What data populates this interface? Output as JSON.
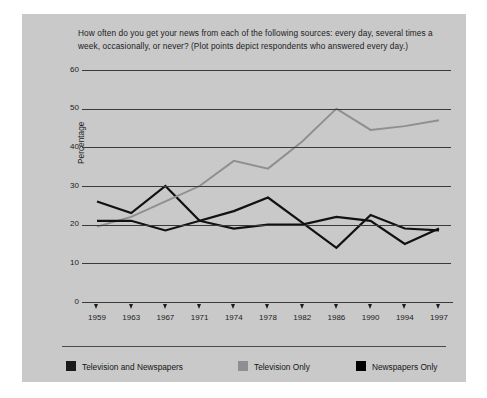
{
  "figure": {
    "background_color": "#c9c9c9",
    "question": "How often do you get your news from each of the following sources: every day, several times a week, occasionally, or never? (Plot points depict respondents who answered every day.)"
  },
  "chart_data": {
    "type": "line",
    "title": "",
    "xlabel": "",
    "ylabel": "Percentage",
    "categories": [
      "1959",
      "1963",
      "1967",
      "1971",
      "1974",
      "1978",
      "1982",
      "1986",
      "1990",
      "1994",
      "1997"
    ],
    "x": [
      1959,
      1963,
      1967,
      1971,
      1974,
      1978,
      1982,
      1986,
      1990,
      1994,
      1997
    ],
    "ylim": [
      0,
      60
    ],
    "yticks": [
      0,
      10,
      20,
      30,
      40,
      50,
      60
    ],
    "grid": true,
    "legend_position": "bottom",
    "series": [
      {
        "name": "Television and Newspapers",
        "color": "#111111",
        "values": [
          26,
          23,
          30,
          21,
          23.5,
          27,
          20.5,
          14,
          22.5,
          19,
          18.5
        ]
      },
      {
        "name": "Television Only",
        "color": "#8f8f8f",
        "values": [
          19.5,
          22,
          26,
          30,
          36.5,
          34.5,
          41.5,
          50,
          44.5,
          45.5,
          47
        ]
      },
      {
        "name": "Newspapers Only",
        "color": "#111111",
        "values": [
          21,
          21,
          18.5,
          21,
          19,
          20,
          20,
          22,
          21,
          15,
          19
        ]
      }
    ]
  },
  "legend": {
    "items": [
      {
        "label": "Television and Newspapers",
        "swatch_color": "#1a1a1a"
      },
      {
        "label": "Television Only",
        "swatch_color": "#8f8f8f"
      },
      {
        "label": "Newspapers Only",
        "swatch_color": "#000000"
      }
    ]
  }
}
